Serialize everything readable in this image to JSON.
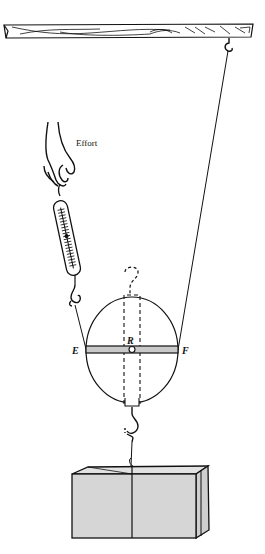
{
  "figure": {
    "labels": {
      "effort": "Effort",
      "left_point": "E",
      "right_point": "F",
      "axle": "R"
    },
    "components": [
      "ceiling-beam",
      "ceiling-hook",
      "supporting-rope",
      "hand",
      "spring-balance",
      "movable-pulley",
      "load-block"
    ],
    "colors": {
      "line": "#111111",
      "bar_fill": "#c9c9c9",
      "load_fill": "#d6d6d6",
      "background": "#ffffff"
    }
  }
}
